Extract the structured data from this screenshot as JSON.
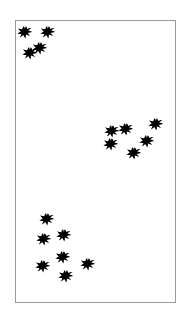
{
  "figure": {
    "background_color": "#ffffff",
    "frame": {
      "border_color": "#9a9a9a",
      "fill_color": "#ffffff",
      "x": 15,
      "y": 20,
      "width": 161,
      "height": 283
    },
    "marker": {
      "icon": "star-burst-marker-icon",
      "color": "#000000",
      "size_px": 16,
      "count": 17
    }
  },
  "chart_data": {
    "type": "scatter",
    "title": "",
    "subtitle": "",
    "xlabel": "",
    "ylabel": "",
    "grid": false,
    "legend": null,
    "axis_ticks": [],
    "xlim": [
      0,
      161
    ],
    "ylim": [
      0,
      283
    ],
    "y_axis_direction": "down",
    "point_color": "#000000",
    "point_marker": "star-burst",
    "series": [
      {
        "name": "points",
        "points": [
          {
            "x": 9,
            "y": 12,
            "cluster": "top-left"
          },
          {
            "x": 32,
            "y": 12,
            "cluster": "top-left"
          },
          {
            "x": 24,
            "y": 28,
            "cluster": "top-left"
          },
          {
            "x": 14,
            "y": 33,
            "cluster": "top-left"
          },
          {
            "x": 97,
            "y": 112,
            "cluster": "middle-right"
          },
          {
            "x": 111,
            "y": 110,
            "cluster": "middle-right"
          },
          {
            "x": 142,
            "y": 105,
            "cluster": "middle-right"
          },
          {
            "x": 96,
            "y": 125,
            "cluster": "middle-right"
          },
          {
            "x": 133,
            "y": 122,
            "cluster": "middle-right"
          },
          {
            "x": 119,
            "y": 134,
            "cluster": "middle-right"
          },
          {
            "x": 31,
            "y": 200,
            "cluster": "bottom-left"
          },
          {
            "x": 28,
            "y": 221,
            "cluster": "bottom-left"
          },
          {
            "x": 49,
            "y": 217,
            "cluster": "bottom-left"
          },
          {
            "x": 48,
            "y": 239,
            "cluster": "bottom-left"
          },
          {
            "x": 27,
            "y": 248,
            "cluster": "bottom-left"
          },
          {
            "x": 73,
            "y": 246,
            "cluster": "bottom-left"
          },
          {
            "x": 51,
            "y": 258,
            "cluster": "bottom-left"
          }
        ]
      }
    ]
  }
}
